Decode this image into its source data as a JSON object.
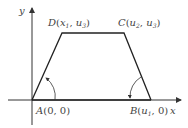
{
  "diagram": {
    "type": "trapezoid-membership-function",
    "axes": {
      "x_label": "x",
      "y_label": "y"
    },
    "points": {
      "A": {
        "name": "A",
        "coords_text": "(0, 0)"
      },
      "B": {
        "name": "B",
        "var": "u",
        "sub": "1",
        "tail": ", 0)"
      },
      "C": {
        "name": "C",
        "var1": "u",
        "sub1": "2",
        "var2": "u",
        "sub2": "3"
      },
      "D": {
        "name": "D",
        "var1": "x",
        "sub1": "1",
        "var2": "u",
        "sub2": "3"
      }
    },
    "colors": {
      "line": "#222222",
      "axis": "#333333",
      "text": "#444444"
    }
  }
}
